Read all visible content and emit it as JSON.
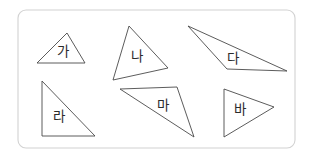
{
  "figure": {
    "canvas": {
      "width": 312,
      "height": 159
    },
    "background_color": "#ffffff",
    "frame": {
      "name": "rounded-border-frame",
      "x": 18,
      "y": 10,
      "width": 277,
      "height": 138,
      "corner_radius": 8,
      "stroke_color": "#d2d2d2",
      "fill_color": "#ffffff"
    },
    "shape_style": {
      "stroke_color": "#4a4a4a",
      "fill_color": "#ffffff",
      "stroke_width": 0.9,
      "label_color": "#2b2b2b",
      "label_font_size": 13.5
    },
    "shapes": [
      {
        "id": "triangle-ga",
        "label": "가",
        "kind": "triangle",
        "description": "acute triangle, apex up",
        "points": "37,63 67,33 85,63",
        "vertices": [
          [
            37,
            63
          ],
          [
            67,
            33
          ],
          [
            85,
            63
          ]
        ],
        "label_x": 63,
        "label_y": 52
      },
      {
        "id": "triangle-na",
        "label": "나",
        "kind": "triangle",
        "description": "tall triangle, apex up tilted right",
        "points": "129,26 168,68 113,80",
        "vertices": [
          [
            129,
            26
          ],
          [
            168,
            68
          ],
          [
            113,
            80
          ]
        ],
        "label_x": 137,
        "label_y": 57
      },
      {
        "id": "triangle-da",
        "label": "다",
        "kind": "triangle",
        "description": "very obtuse thin triangle pointing left",
        "points": "188,26 287,71 227,69",
        "vertices": [
          [
            188,
            26
          ],
          [
            287,
            71
          ],
          [
            227,
            69
          ]
        ],
        "label_x": 233,
        "label_y": 59
      },
      {
        "id": "triangle-ra",
        "label": "라",
        "kind": "triangle",
        "description": "right triangle, right angle bottom-left",
        "points": "42,81 42,136 95,136",
        "vertices": [
          [
            42,
            81
          ],
          [
            42,
            136
          ],
          [
            95,
            136
          ]
        ],
        "label_x": 59,
        "label_y": 117
      },
      {
        "id": "triangle-ma",
        "label": "마",
        "kind": "triangle",
        "description": "obtuse triangle pointing down-right",
        "points": "120,89 177,87 194,137",
        "vertices": [
          [
            120,
            89
          ],
          [
            177,
            87
          ],
          [
            194,
            137
          ]
        ],
        "label_x": 163,
        "label_y": 106
      },
      {
        "id": "triangle-ba",
        "label": "바",
        "kind": "triangle",
        "description": "isosceles triangle pointing right",
        "points": "224,89 274,107 224,137",
        "vertices": [
          [
            224,
            89
          ],
          [
            274,
            107
          ],
          [
            224,
            137
          ]
        ],
        "label_x": 240,
        "label_y": 110
      }
    ]
  }
}
